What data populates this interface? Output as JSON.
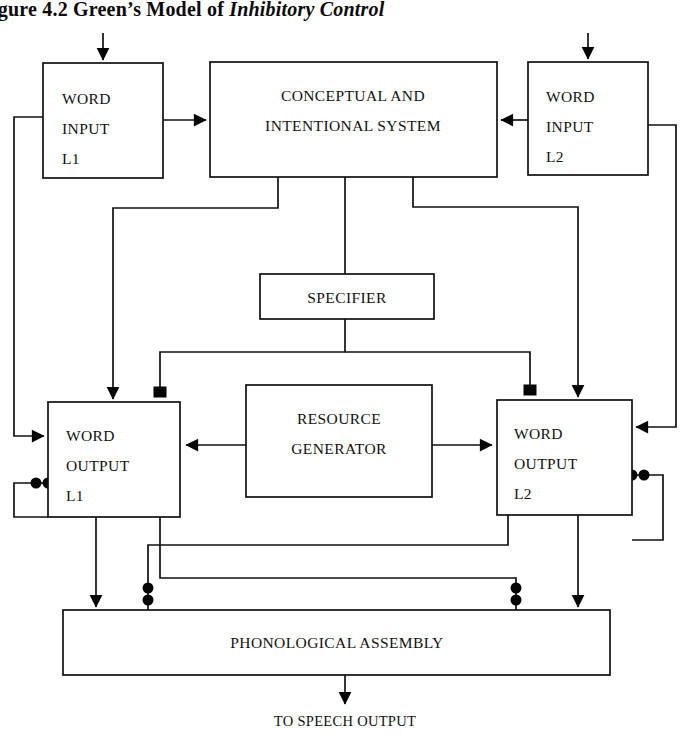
{
  "figure": {
    "title_prefix": "igure 4.2 Green’s Model of ",
    "title_italic": "Inhibitory Control",
    "full_title": "igure 4.2 Green’s Model of Inhibitory Control"
  },
  "nodes": {
    "word_input_l1": {
      "line1": "WORD",
      "line2": "INPUT",
      "line3": "L1"
    },
    "conceptual_system": {
      "line1": "CONCEPTUAL AND",
      "line2": "INTENTIONAL SYSTEM"
    },
    "word_input_l2": {
      "line1": "WORD",
      "line2": "INPUT",
      "line3": "L2"
    },
    "specifier": {
      "line1": "SPECIFIER"
    },
    "word_output_l1": {
      "line1": "WORD",
      "line2": "OUTPUT",
      "line3": "L1"
    },
    "resource_generator": {
      "line1": "RESOURCE",
      "line2": "GENERATOR"
    },
    "word_output_l2": {
      "line1": "WORD",
      "line2": "OUTPUT",
      "line3": "L2"
    },
    "phonological_assembly": {
      "line1": "PHONOLOGICAL ASSEMBLY"
    }
  },
  "captions": {
    "speech_output": "TO SPEECH OUTPUT"
  },
  "colors": {
    "ink": "#111111",
    "page": "#ffffff"
  }
}
